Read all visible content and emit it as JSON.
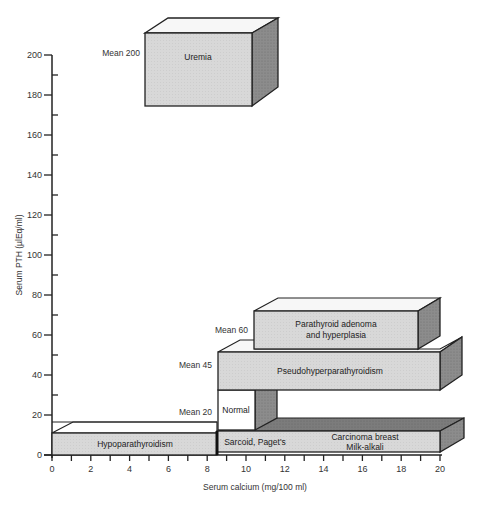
{
  "chart_data": {
    "type": "3d-range-boxes",
    "title": "",
    "xlabel": "Serum calcium (mg/100 ml)",
    "ylabel": "Serum PTH (µlEq/ml)",
    "xlim": [
      0,
      20
    ],
    "ylim": [
      0,
      200
    ],
    "x_ticks": [
      "0",
      "2",
      "4",
      "6",
      "8",
      "10",
      "12",
      "14",
      "16",
      "18",
      "20"
    ],
    "y_ticks": [
      "0",
      "20",
      "40",
      "60",
      "80",
      "100",
      "120",
      "140",
      "160",
      "180",
      "200"
    ],
    "grid": false,
    "boxes": [
      {
        "label": "Uremia",
        "x_range": [
          4.8,
          10.2
        ],
        "y_range": [
          170,
          210
        ],
        "mean_label": "Mean 200",
        "shade": "light"
      },
      {
        "label": "Hypoparathyroidism",
        "x_range": [
          0,
          8.5
        ],
        "y_range": [
          0,
          10
        ],
        "mean_label": "",
        "shade": "light"
      },
      {
        "label": "Sarcoid, Paget's",
        "x_range": [
          8.5,
          12.5
        ],
        "y_range": [
          0,
          10
        ],
        "mean_label": "",
        "shade": "light"
      },
      {
        "label": "Carcinoma breast / Milk-alkali",
        "x_range": [
          12.5,
          20
        ],
        "y_range": [
          0,
          10
        ],
        "mean_label": "",
        "shade": "light"
      },
      {
        "label": "Normal",
        "x_range": [
          8.5,
          10.4
        ],
        "y_range": [
          12,
          30
        ],
        "mean_label": "Mean 20",
        "shade": "white"
      },
      {
        "label": "Pseudohyperparathyroidism",
        "x_range": [
          8.5,
          20
        ],
        "y_range": [
          32,
          50
        ],
        "mean_label": "Mean 45",
        "shade": "light"
      },
      {
        "label": "Parathyroid adenoma and hyperplasia",
        "x_range": [
          10.4,
          19
        ],
        "y_range": [
          52,
          70
        ],
        "mean_label": "Mean 60",
        "shade": "light"
      }
    ]
  },
  "axes": {
    "x_title": "Serum calcium (mg/100 ml)",
    "y_title": "Serum PTH (µlEq/ml)",
    "x_ticks": [
      "0",
      "2",
      "4",
      "6",
      "8",
      "10",
      "12",
      "14",
      "16",
      "18",
      "20"
    ],
    "y_ticks": [
      "0",
      "20",
      "40",
      "60",
      "80",
      "100",
      "120",
      "140",
      "160",
      "180",
      "200"
    ]
  },
  "boxes": {
    "uremia": {
      "label": "Uremia",
      "mean": "Mean 200"
    },
    "hypo": {
      "label": "Hypoparathyroidism"
    },
    "sarcoid": {
      "label": "Sarcoid, Paget's"
    },
    "carcinoma": {
      "line1": "Carcinoma  breast",
      "line2": "Milk-alkali"
    },
    "normal": {
      "label": "Normal",
      "mean": "Mean 20"
    },
    "pseudo": {
      "label": "Pseudohyperparathyroidism",
      "mean": "Mean 45"
    },
    "adenoma": {
      "line1": "Parathyroid adenoma",
      "line2": "and hyperplasia",
      "mean": "Mean 60"
    }
  },
  "colors": {
    "front": "#d6d6d6",
    "top": "#f7f7f7",
    "side": "#8a8a8a",
    "dark_top": "#777777",
    "stroke": "#222222",
    "white": "#ffffff"
  }
}
